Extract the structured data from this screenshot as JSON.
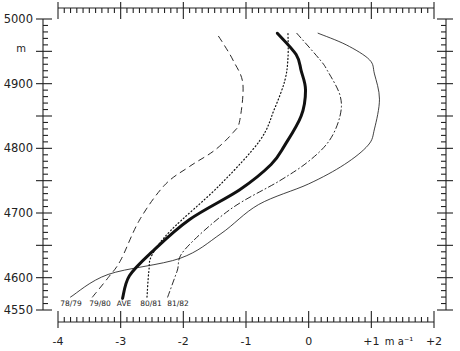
{
  "chart_data": {
    "type": "line",
    "title": "",
    "xlabel": "m a⁻¹",
    "ylabel": "m",
    "xlim": [
      -4,
      2
    ],
    "ylim": [
      4550,
      5000
    ],
    "grid": false,
    "legend_position": "inline labels at bottom of each curve",
    "x_tick_labels": [
      "-4",
      "-3",
      "-2",
      "-1",
      "0",
      "+1",
      "+2"
    ],
    "y_tick_labels": [
      "4550",
      "4600",
      "4700",
      "4800",
      "4900",
      "5000"
    ],
    "x_unit_label": "m a⁻¹",
    "y_unit_label": "m",
    "series": [
      {
        "name": "78/79",
        "style": "thin-solid",
        "points": [
          [
            -3.8,
            4570
          ],
          [
            -3.2,
            4605
          ],
          [
            -2.05,
            4630
          ],
          [
            -1.4,
            4668
          ],
          [
            -0.8,
            4713
          ],
          [
            0.0,
            4745
          ],
          [
            0.57,
            4775
          ],
          [
            0.95,
            4805
          ],
          [
            1.05,
            4830
          ],
          [
            1.13,
            4876
          ],
          [
            1.05,
            4915
          ],
          [
            0.97,
            4937
          ],
          [
            0.6,
            4960
          ],
          [
            0.15,
            4978
          ]
        ]
      },
      {
        "name": "79/80",
        "style": "dashed",
        "points": [
          [
            -3.45,
            4570
          ],
          [
            -3.2,
            4600
          ],
          [
            -3.0,
            4627
          ],
          [
            -2.7,
            4689
          ],
          [
            -2.3,
            4743
          ],
          [
            -1.9,
            4772
          ],
          [
            -1.5,
            4797
          ],
          [
            -1.2,
            4825
          ],
          [
            -1.1,
            4843
          ],
          [
            -1.05,
            4900
          ],
          [
            -1.2,
            4935
          ],
          [
            -1.35,
            4960
          ],
          [
            -1.45,
            4975
          ]
        ]
      },
      {
        "name": "AVE",
        "style": "thick-solid",
        "points": [
          [
            -2.97,
            4568
          ],
          [
            -2.86,
            4603
          ],
          [
            -2.5,
            4640
          ],
          [
            -1.9,
            4690
          ],
          [
            -1.1,
            4736
          ],
          [
            -0.6,
            4775
          ],
          [
            -0.38,
            4805
          ],
          [
            -0.12,
            4850
          ],
          [
            -0.05,
            4890
          ],
          [
            -0.12,
            4920
          ],
          [
            -0.2,
            4945
          ],
          [
            -0.5,
            4978
          ]
        ]
      },
      {
        "name": "80/81",
        "style": "dotted",
        "points": [
          [
            -2.58,
            4570
          ],
          [
            -2.55,
            4610
          ],
          [
            -2.5,
            4635
          ],
          [
            -2.2,
            4673
          ],
          [
            -1.42,
            4743
          ],
          [
            -0.78,
            4812
          ],
          [
            -0.55,
            4860
          ],
          [
            -0.38,
            4905
          ],
          [
            -0.33,
            4940
          ],
          [
            -0.33,
            4978
          ]
        ]
      },
      {
        "name": "81/82",
        "style": "dash-dot",
        "points": [
          [
            -2.25,
            4570
          ],
          [
            -2.1,
            4610
          ],
          [
            -1.98,
            4643
          ],
          [
            -1.26,
            4705
          ],
          [
            -0.46,
            4750
          ],
          [
            0.0,
            4780
          ],
          [
            0.33,
            4812
          ],
          [
            0.5,
            4850
          ],
          [
            0.5,
            4882
          ],
          [
            0.3,
            4920
          ],
          [
            0.18,
            4937
          ],
          [
            -0.19,
            4978
          ]
        ]
      }
    ]
  }
}
